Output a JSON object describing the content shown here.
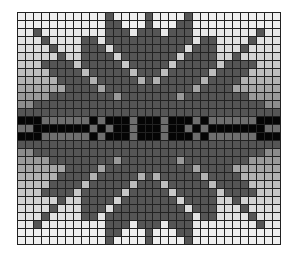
{
  "grid": {
    "columns": 33,
    "rows": 29,
    "legend": {
      "0": "background (row-graded shade)",
      "1": "motif dark grey",
      "2": "band black",
      "3": "band grey"
    },
    "colors": {
      "motif": "#555555",
      "band_black": "#050505",
      "band_grey": "#6e6e6e",
      "grid_line": "#222222"
    },
    "row_background": [
      "#efefef",
      "#efefef",
      "#e9e9e9",
      "#e2e2e2",
      "#dcdcdc",
      "#d2d2d2",
      "#c8c8c8",
      "#bdbdbd",
      "#b2b2b2",
      "#a6a6a6",
      "#9a9a9a",
      "#8c8c8c",
      "#808080",
      "#747474",
      "#747474",
      "#747474",
      "#808080",
      "#8c8c8c",
      "#9a9a9a",
      "#a6a6a6",
      "#b2b2b2",
      "#bdbdbd",
      "#c8c8c8",
      "#d2d2d2",
      "#dcdcdc",
      "#e2e2e2",
      "#e9e9e9",
      "#efefef",
      "#efefef"
    ],
    "quadrant_top_left": [
      [
        0,
        0,
        0,
        0,
        0,
        0,
        0,
        0,
        0,
        0,
        0,
        1,
        0,
        0,
        0,
        0,
        1
      ],
      [
        0,
        0,
        0,
        0,
        0,
        0,
        0,
        0,
        0,
        0,
        0,
        1,
        1,
        0,
        0,
        0,
        1
      ],
      [
        0,
        0,
        1,
        0,
        0,
        0,
        0,
        0,
        0,
        0,
        0,
        1,
        1,
        1,
        0,
        1,
        1
      ],
      [
        0,
        0,
        0,
        1,
        0,
        0,
        0,
        0,
        1,
        1,
        0,
        1,
        1,
        1,
        1,
        1,
        1
      ],
      [
        0,
        0,
        0,
        0,
        1,
        0,
        0,
        0,
        1,
        1,
        1,
        0,
        1,
        1,
        1,
        1,
        1
      ],
      [
        0,
        0,
        0,
        0,
        0,
        1,
        0,
        0,
        1,
        1,
        1,
        1,
        0,
        1,
        1,
        1,
        1
      ],
      [
        0,
        0,
        0,
        1,
        1,
        1,
        1,
        0,
        1,
        1,
        1,
        1,
        1,
        0,
        1,
        1,
        1
      ],
      [
        0,
        0,
        0,
        0,
        1,
        1,
        1,
        1,
        0,
        1,
        1,
        1,
        1,
        1,
        0,
        1,
        1
      ],
      [
        0,
        0,
        0,
        0,
        0,
        1,
        1,
        1,
        1,
        0,
        1,
        1,
        1,
        1,
        1,
        0,
        1
      ],
      [
        0,
        0,
        0,
        0,
        0,
        0,
        1,
        1,
        1,
        1,
        0,
        1,
        1,
        1,
        1,
        1,
        1
      ],
      [
        0,
        0,
        0,
        0,
        1,
        1,
        1,
        1,
        1,
        1,
        1,
        1,
        0,
        1,
        1,
        1,
        1
      ],
      [
        0,
        0,
        1,
        1,
        1,
        1,
        1,
        1,
        1,
        1,
        1,
        1,
        1,
        1,
        1,
        1,
        1
      ],
      [
        1,
        1,
        1,
        1,
        1,
        1,
        1,
        1,
        1,
        1,
        1,
        1,
        1,
        1,
        1,
        1,
        1
      ],
      [
        2,
        2,
        2,
        3,
        3,
        3,
        3,
        3,
        3,
        2,
        3,
        2,
        2,
        2,
        3,
        2,
        2
      ],
      [
        3,
        3,
        2,
        2,
        2,
        2,
        2,
        2,
        2,
        3,
        2,
        3,
        2,
        2,
        3,
        2,
        2
      ]
    ]
  }
}
